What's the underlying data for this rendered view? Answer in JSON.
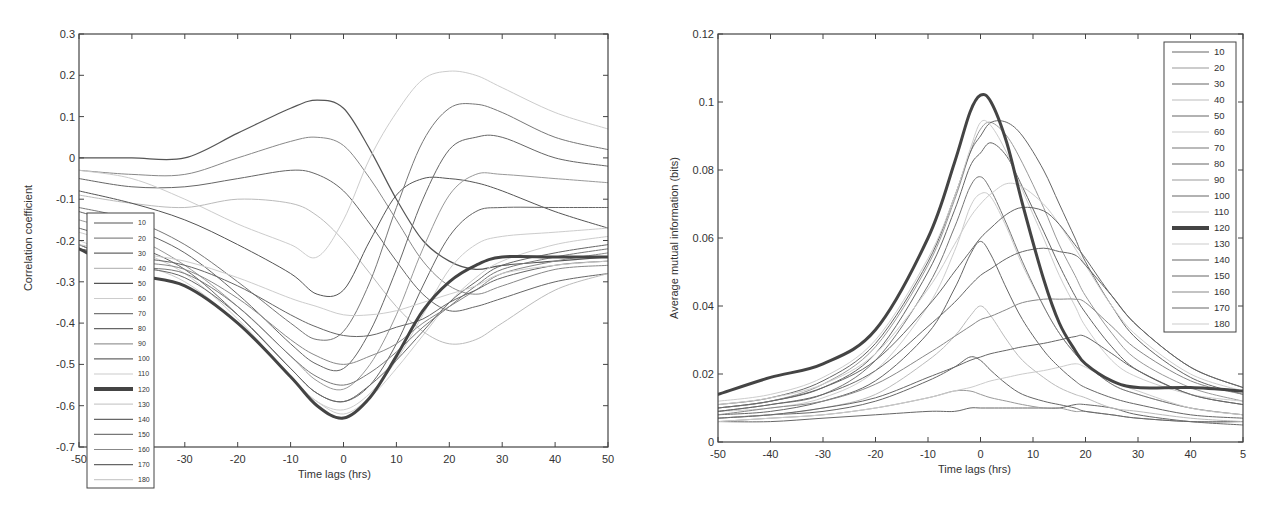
{
  "chart_data": [
    {
      "type": "line",
      "title": "",
      "xlabel": "Time lags (hrs)",
      "ylabel": "Correlation coefficient",
      "xlim": [
        -50,
        50
      ],
      "ylim": [
        -0.7,
        0.3
      ],
      "xticks": [
        -50,
        -40,
        -30,
        -20,
        -10,
        0,
        10,
        20,
        30,
        40,
        50
      ],
      "yticks": [
        -0.7,
        -0.6,
        -0.5,
        -0.4,
        -0.3,
        -0.2,
        -0.1,
        0,
        0.1,
        0.2,
        0.3
      ],
      "ytick_labels": [
        "-0.7",
        "-0.6",
        "-0.5",
        "-0.4",
        "-0.3",
        "-0.2",
        "-0.1",
        "0",
        "0.1",
        "0.2",
        "0.3"
      ],
      "grid": false,
      "legend_position": "lower-left inside",
      "highlight_series": "120",
      "x": [
        -50,
        -40,
        -30,
        -20,
        -10,
        -5,
        0,
        5,
        10,
        15,
        20,
        25,
        30,
        40,
        50
      ],
      "series": [
        {
          "name": "10",
          "color": "#555555",
          "width": 1.2,
          "values": [
            0.0,
            0.0,
            0.0,
            0.06,
            0.12,
            0.14,
            0.12,
            0.02,
            -0.1,
            -0.2,
            -0.25,
            -0.27,
            -0.26,
            -0.25,
            -0.24
          ]
        },
        {
          "name": "20",
          "color": "#888888",
          "width": 1.0,
          "values": [
            -0.03,
            -0.04,
            -0.04,
            0.0,
            0.04,
            0.05,
            0.03,
            -0.05,
            -0.15,
            -0.25,
            -0.31,
            -0.33,
            -0.31,
            -0.27,
            -0.26
          ]
        },
        {
          "name": "30",
          "color": "#666666",
          "width": 1.0,
          "values": [
            -0.05,
            -0.07,
            -0.07,
            -0.05,
            -0.03,
            -0.04,
            -0.08,
            -0.16,
            -0.25,
            -0.33,
            -0.37,
            -0.36,
            -0.34,
            -0.3,
            -0.28
          ]
        },
        {
          "name": "40",
          "color": "#bbbbbb",
          "width": 1.0,
          "values": [
            -0.09,
            -0.11,
            -0.12,
            -0.1,
            -0.11,
            -0.14,
            -0.2,
            -0.28,
            -0.36,
            -0.42,
            -0.45,
            -0.44,
            -0.4,
            -0.32,
            -0.28
          ]
        },
        {
          "name": "50",
          "color": "#555555",
          "width": 1.0,
          "values": [
            -0.08,
            -0.11,
            -0.15,
            -0.21,
            -0.28,
            -0.33,
            -0.32,
            -0.2,
            -0.09,
            -0.05,
            -0.05,
            -0.06,
            -0.08,
            -0.13,
            -0.17
          ]
        },
        {
          "name": "60",
          "color": "#cccccc",
          "width": 1.0,
          "values": [
            -0.03,
            -0.05,
            -0.1,
            -0.16,
            -0.21,
            -0.24,
            -0.15,
            0.0,
            0.11,
            0.19,
            0.21,
            0.2,
            0.17,
            0.11,
            0.07
          ]
        },
        {
          "name": "70",
          "color": "#777777",
          "width": 1.0,
          "values": [
            -0.12,
            -0.15,
            -0.21,
            -0.3,
            -0.4,
            -0.44,
            -0.42,
            -0.3,
            -0.12,
            0.04,
            0.12,
            0.13,
            0.11,
            0.05,
            0.02
          ]
        },
        {
          "name": "80",
          "color": "#666666",
          "width": 1.0,
          "values": [
            -0.13,
            -0.17,
            -0.23,
            -0.33,
            -0.45,
            -0.5,
            -0.51,
            -0.42,
            -0.27,
            -0.1,
            0.02,
            0.05,
            0.05,
            0.0,
            -0.02
          ]
        },
        {
          "name": "90",
          "color": "#999999",
          "width": 1.0,
          "values": [
            -0.15,
            -0.19,
            -0.26,
            -0.36,
            -0.48,
            -0.54,
            -0.56,
            -0.5,
            -0.38,
            -0.22,
            -0.09,
            -0.04,
            -0.04,
            -0.05,
            -0.06
          ]
        },
        {
          "name": "100",
          "color": "#666666",
          "width": 1.0,
          "values": [
            -0.17,
            -0.21,
            -0.27,
            -0.38,
            -0.51,
            -0.57,
            -0.59,
            -0.55,
            -0.45,
            -0.31,
            -0.19,
            -0.13,
            -0.12,
            -0.12,
            -0.12
          ]
        },
        {
          "name": "110",
          "color": "#cccccc",
          "width": 1.0,
          "values": [
            -0.18,
            -0.22,
            -0.28,
            -0.39,
            -0.53,
            -0.59,
            -0.61,
            -0.57,
            -0.49,
            -0.38,
            -0.27,
            -0.21,
            -0.19,
            -0.18,
            -0.17
          ]
        },
        {
          "name": "120",
          "color": "#444444",
          "width": 3.0,
          "values": [
            -0.22,
            -0.28,
            -0.31,
            -0.4,
            -0.53,
            -0.6,
            -0.63,
            -0.58,
            -0.48,
            -0.37,
            -0.3,
            -0.26,
            -0.24,
            -0.24,
            -0.24
          ]
        },
        {
          "name": "130",
          "color": "#cccccc",
          "width": 1.0,
          "values": [
            -0.2,
            -0.25,
            -0.3,
            -0.4,
            -0.53,
            -0.59,
            -0.62,
            -0.58,
            -0.51,
            -0.43,
            -0.35,
            -0.29,
            -0.25,
            -0.21,
            -0.19
          ]
        },
        {
          "name": "140",
          "color": "#666666",
          "width": 1.0,
          "values": [
            -0.21,
            -0.26,
            -0.29,
            -0.38,
            -0.51,
            -0.57,
            -0.59,
            -0.55,
            -0.49,
            -0.42,
            -0.35,
            -0.3,
            -0.26,
            -0.23,
            -0.21
          ]
        },
        {
          "name": "150",
          "color": "#777777",
          "width": 1.0,
          "values": [
            -0.21,
            -0.26,
            -0.28,
            -0.36,
            -0.48,
            -0.53,
            -0.55,
            -0.52,
            -0.47,
            -0.41,
            -0.36,
            -0.31,
            -0.27,
            -0.24,
            -0.22
          ]
        },
        {
          "name": "160",
          "color": "#888888",
          "width": 1.0,
          "values": [
            -0.22,
            -0.25,
            -0.27,
            -0.34,
            -0.44,
            -0.48,
            -0.5,
            -0.48,
            -0.45,
            -0.4,
            -0.36,
            -0.32,
            -0.28,
            -0.25,
            -0.23
          ]
        },
        {
          "name": "170",
          "color": "#666666",
          "width": 1.0,
          "values": [
            -0.22,
            -0.24,
            -0.26,
            -0.31,
            -0.38,
            -0.41,
            -0.43,
            -0.43,
            -0.41,
            -0.39,
            -0.35,
            -0.32,
            -0.29,
            -0.26,
            -0.25
          ]
        },
        {
          "name": "180",
          "color": "#cccccc",
          "width": 1.0,
          "values": [
            -0.21,
            -0.23,
            -0.25,
            -0.29,
            -0.34,
            -0.36,
            -0.38,
            -0.38,
            -0.37,
            -0.35,
            -0.33,
            -0.31,
            -0.28,
            -0.26,
            -0.25
          ]
        }
      ]
    },
    {
      "type": "line",
      "title": "",
      "xlabel": "Time lags (hrs)",
      "ylabel": "Average mutual information (bits)",
      "xlim": [
        -50,
        50
      ],
      "ylim": [
        0,
        0.12
      ],
      "xticks": [
        -50,
        -40,
        -30,
        -20,
        -10,
        0,
        10,
        20,
        30,
        40,
        50
      ],
      "xtick_labels": [
        "-50",
        "-40",
        "-30",
        "-20",
        "-10",
        "0",
        "10",
        "20",
        "30",
        "40",
        "5"
      ],
      "yticks": [
        0,
        0.02,
        0.04,
        0.06,
        0.08,
        0.1,
        0.12
      ],
      "ytick_labels": [
        "0",
        "0.02",
        "0.04",
        "0.06",
        "0.08",
        "0.1",
        "0.12"
      ],
      "grid": false,
      "legend_position": "upper-right inside",
      "highlight_series": "120",
      "x": [
        -50,
        -40,
        -30,
        -20,
        -10,
        -5,
        -2,
        0,
        2,
        5,
        8,
        12,
        15,
        18,
        20,
        25,
        30,
        40,
        50
      ],
      "series": [
        {
          "name": "10",
          "color": "#666666",
          "width": 1.0,
          "values": [
            0.006,
            0.006,
            0.007,
            0.008,
            0.009,
            0.009,
            0.01,
            0.01,
            0.01,
            0.01,
            0.01,
            0.01,
            0.01,
            0.011,
            0.011,
            0.01,
            0.008,
            0.006,
            0.005
          ]
        },
        {
          "name": "20",
          "color": "#999999",
          "width": 1.0,
          "values": [
            0.006,
            0.007,
            0.008,
            0.01,
            0.013,
            0.015,
            0.015,
            0.014,
            0.013,
            0.012,
            0.011,
            0.01,
            0.01,
            0.009,
            0.009,
            0.008,
            0.007,
            0.006,
            0.006
          ]
        },
        {
          "name": "30",
          "color": "#666666",
          "width": 1.0,
          "values": [
            0.007,
            0.008,
            0.009,
            0.012,
            0.018,
            0.022,
            0.025,
            0.024,
            0.021,
            0.017,
            0.014,
            0.012,
            0.011,
            0.01,
            0.009,
            0.008,
            0.007,
            0.006,
            0.006
          ]
        },
        {
          "name": "40",
          "color": "#bbbbbb",
          "width": 1.0,
          "values": [
            0.007,
            0.008,
            0.01,
            0.014,
            0.024,
            0.031,
            0.037,
            0.04,
            0.037,
            0.03,
            0.024,
            0.019,
            0.016,
            0.014,
            0.013,
            0.01,
            0.009,
            0.007,
            0.006
          ]
        },
        {
          "name": "50",
          "color": "#666666",
          "width": 1.0,
          "values": [
            0.008,
            0.009,
            0.012,
            0.018,
            0.032,
            0.045,
            0.055,
            0.059,
            0.055,
            0.045,
            0.036,
            0.027,
            0.022,
            0.018,
            0.016,
            0.013,
            0.011,
            0.008,
            0.007
          ]
        },
        {
          "name": "60",
          "color": "#cccccc",
          "width": 1.0,
          "values": [
            0.009,
            0.01,
            0.013,
            0.021,
            0.04,
            0.056,
            0.069,
            0.073,
            0.072,
            0.063,
            0.052,
            0.04,
            0.032,
            0.026,
            0.023,
            0.017,
            0.014,
            0.01,
            0.008
          ]
        },
        {
          "name": "70",
          "color": "#777777",
          "width": 1.0,
          "values": [
            0.009,
            0.011,
            0.014,
            0.024,
            0.046,
            0.063,
            0.075,
            0.078,
            0.074,
            0.064,
            0.053,
            0.04,
            0.032,
            0.026,
            0.023,
            0.017,
            0.014,
            0.01,
            0.008
          ]
        },
        {
          "name": "80",
          "color": "#666666",
          "width": 1.0,
          "values": [
            0.01,
            0.012,
            0.016,
            0.026,
            0.05,
            0.068,
            0.081,
            0.085,
            0.088,
            0.084,
            0.075,
            0.062,
            0.052,
            0.043,
            0.038,
            0.028,
            0.021,
            0.014,
            0.011
          ]
        },
        {
          "name": "90",
          "color": "#999999",
          "width": 1.0,
          "values": [
            0.01,
            0.012,
            0.017,
            0.028,
            0.052,
            0.071,
            0.085,
            0.092,
            0.094,
            0.09,
            0.082,
            0.069,
            0.058,
            0.049,
            0.043,
            0.032,
            0.024,
            0.016,
            0.012
          ]
        },
        {
          "name": "100",
          "color": "#666666",
          "width": 1.0,
          "values": [
            0.011,
            0.013,
            0.018,
            0.029,
            0.053,
            0.072,
            0.085,
            0.09,
            0.094,
            0.094,
            0.09,
            0.08,
            0.07,
            0.06,
            0.053,
            0.04,
            0.03,
            0.019,
            0.014
          ]
        },
        {
          "name": "110",
          "color": "#cccccc",
          "width": 1.0,
          "values": [
            0.012,
            0.014,
            0.019,
            0.03,
            0.054,
            0.072,
            0.086,
            0.094,
            0.093,
            0.085,
            0.074,
            0.06,
            0.049,
            0.04,
            0.034,
            0.024,
            0.019,
            0.014,
            0.012
          ]
        },
        {
          "name": "120",
          "color": "#444444",
          "width": 3.0,
          "values": [
            0.014,
            0.019,
            0.023,
            0.033,
            0.06,
            0.082,
            0.097,
            0.102,
            0.1,
            0.088,
            0.07,
            0.048,
            0.035,
            0.027,
            0.023,
            0.018,
            0.016,
            0.016,
            0.015
          ]
        },
        {
          "name": "130",
          "color": "#cccccc",
          "width": 1.0,
          "values": [
            0.011,
            0.013,
            0.017,
            0.026,
            0.045,
            0.058,
            0.066,
            0.07,
            0.073,
            0.076,
            0.075,
            0.07,
            0.064,
            0.057,
            0.052,
            0.04,
            0.031,
            0.02,
            0.015
          ]
        },
        {
          "name": "140",
          "color": "#666666",
          "width": 1.0,
          "values": [
            0.01,
            0.012,
            0.016,
            0.024,
            0.04,
            0.05,
            0.056,
            0.06,
            0.063,
            0.067,
            0.069,
            0.068,
            0.064,
            0.058,
            0.054,
            0.043,
            0.034,
            0.022,
            0.016
          ]
        },
        {
          "name": "150",
          "color": "#666666",
          "width": 1.0,
          "values": [
            0.009,
            0.011,
            0.014,
            0.021,
            0.034,
            0.041,
            0.046,
            0.049,
            0.051,
            0.054,
            0.056,
            0.057,
            0.056,
            0.055,
            0.052,
            0.043,
            0.034,
            0.022,
            0.016
          ]
        },
        {
          "name": "160",
          "color": "#888888",
          "width": 1.0,
          "values": [
            0.008,
            0.01,
            0.012,
            0.017,
            0.026,
            0.031,
            0.034,
            0.036,
            0.037,
            0.039,
            0.041,
            0.042,
            0.042,
            0.042,
            0.041,
            0.034,
            0.027,
            0.018,
            0.014
          ]
        },
        {
          "name": "170",
          "color": "#666666",
          "width": 1.0,
          "values": [
            0.007,
            0.008,
            0.01,
            0.013,
            0.019,
            0.022,
            0.024,
            0.025,
            0.026,
            0.027,
            0.028,
            0.029,
            0.03,
            0.031,
            0.031,
            0.026,
            0.021,
            0.014,
            0.011
          ]
        },
        {
          "name": "180",
          "color": "#cccccc",
          "width": 1.0,
          "values": [
            0.006,
            0.007,
            0.008,
            0.01,
            0.013,
            0.015,
            0.016,
            0.017,
            0.018,
            0.019,
            0.02,
            0.021,
            0.022,
            0.023,
            0.022,
            0.018,
            0.015,
            0.01,
            0.008
          ]
        }
      ]
    }
  ]
}
